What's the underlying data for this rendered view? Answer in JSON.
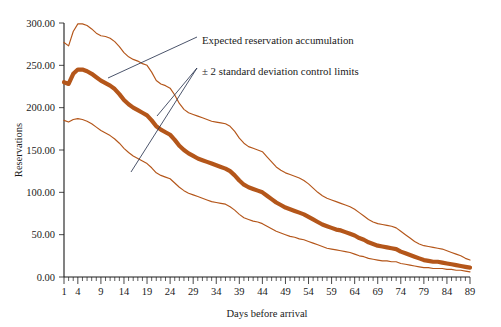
{
  "chart_data": {
    "type": "line",
    "title": "",
    "xlabel": "Days before arrival",
    "ylabel": "Reservations",
    "xlim": [
      1,
      89
    ],
    "ylim": [
      0,
      300
    ],
    "grid": false,
    "legend_position": "none",
    "xticks": [
      1,
      4,
      9,
      14,
      19,
      24,
      29,
      34,
      39,
      44,
      49,
      54,
      59,
      64,
      69,
      74,
      79,
      84,
      89
    ],
    "xtick_labels": [
      "1",
      "4",
      "9",
      "14",
      "19",
      "24",
      "29",
      "34",
      "39",
      "44",
      "49",
      "54",
      "59",
      "64",
      "69",
      "74",
      "79",
      "84",
      "89"
    ],
    "yticks": [
      0,
      50,
      100,
      150,
      200,
      250,
      300
    ],
    "ytick_labels": [
      "0.00",
      "50.00",
      "100.00",
      "150.00",
      "200.00",
      "250.00",
      "300.00"
    ],
    "minor_tick_interval": 1,
    "series_color": "#b4561a",
    "annotations": [
      {
        "name": "expected-reservation-accumulation",
        "text": "Expected reservation accumulation",
        "text_x": 197,
        "text_y": 40,
        "leader_from_x": 197,
        "leader_from_y": 37,
        "leader_to_x": 108,
        "leader_to_y": 78
      },
      {
        "name": "control-limits",
        "text": "± 2 standard deviation control limits",
        "text_x": 197,
        "text_y": 71,
        "leader_from_x": 197,
        "leader_from_y": 68,
        "leader_to_x": 157,
        "leader_to_y": 116,
        "leader2_to_x": 131,
        "leader2_to_y": 172
      }
    ],
    "x": [
      1,
      2,
      3,
      4,
      5,
      6,
      7,
      8,
      9,
      10,
      11,
      12,
      13,
      14,
      15,
      16,
      17,
      18,
      19,
      20,
      21,
      22,
      23,
      24,
      25,
      26,
      27,
      28,
      29,
      30,
      31,
      32,
      33,
      34,
      35,
      36,
      37,
      38,
      39,
      40,
      41,
      42,
      43,
      44,
      45,
      46,
      47,
      48,
      49,
      50,
      51,
      52,
      53,
      54,
      55,
      56,
      57,
      58,
      59,
      60,
      61,
      62,
      63,
      64,
      65,
      66,
      67,
      68,
      69,
      70,
      71,
      72,
      73,
      74,
      75,
      76,
      77,
      78,
      79,
      80,
      81,
      82,
      83,
      84,
      85,
      86,
      87,
      88,
      89
    ],
    "series": [
      {
        "name": "Upper control limit (+2 SD)",
        "style": "thin",
        "values": [
          277,
          273,
          290,
          299,
          299,
          297,
          293,
          288,
          285,
          284,
          282,
          278,
          272,
          265,
          260,
          257,
          255,
          252,
          250,
          242,
          232,
          228,
          226,
          223,
          215,
          205,
          198,
          194,
          192,
          190,
          188,
          186,
          184,
          183,
          182,
          181,
          178,
          172,
          164,
          158,
          154,
          152,
          150,
          148,
          142,
          136,
          130,
          126,
          123,
          121,
          119,
          117,
          114,
          110,
          105,
          100,
          96,
          93,
          91,
          89,
          87,
          85,
          83,
          80,
          76,
          72,
          68,
          65,
          63,
          62,
          61,
          60,
          58,
          54,
          50,
          46,
          42,
          39,
          37,
          36,
          35,
          34,
          33,
          31,
          29,
          27,
          25,
          22,
          20
        ]
      },
      {
        "name": "Expected reservation accumulation",
        "style": "thick",
        "values": [
          230,
          228,
          240,
          245,
          245,
          243,
          240,
          236,
          232,
          229,
          226,
          222,
          216,
          209,
          204,
          200,
          197,
          194,
          191,
          185,
          178,
          174,
          171,
          168,
          162,
          155,
          150,
          146,
          143,
          140,
          138,
          136,
          134,
          132,
          130,
          128,
          125,
          120,
          114,
          109,
          106,
          104,
          102,
          100,
          96,
          92,
          88,
          85,
          82,
          80,
          78,
          76,
          74,
          71,
          68,
          65,
          62,
          60,
          58,
          56,
          55,
          53,
          51,
          49,
          46,
          44,
          41,
          39,
          37,
          36,
          35,
          34,
          33,
          30,
          28,
          26,
          24,
          22,
          20,
          19,
          18,
          18,
          17,
          16,
          15,
          14,
          13,
          12,
          11
        ]
      },
      {
        "name": "Lower control limit (−2 SD)",
        "style": "thin",
        "values": [
          185,
          183,
          186,
          187,
          186,
          184,
          181,
          177,
          173,
          170,
          167,
          163,
          158,
          152,
          147,
          143,
          140,
          137,
          134,
          129,
          123,
          120,
          118,
          116,
          111,
          106,
          102,
          99,
          97,
          95,
          93,
          91,
          89,
          88,
          87,
          86,
          83,
          79,
          74,
          70,
          68,
          66,
          65,
          63,
          60,
          57,
          54,
          52,
          50,
          48,
          47,
          45,
          44,
          42,
          40,
          38,
          36,
          34,
          33,
          32,
          31,
          30,
          29,
          27,
          25,
          24,
          22,
          21,
          20,
          19,
          19,
          18,
          18,
          16,
          15,
          14,
          13,
          12,
          11,
          11,
          10,
          10,
          10,
          9,
          9,
          8,
          8,
          7,
          6
        ]
      }
    ]
  }
}
